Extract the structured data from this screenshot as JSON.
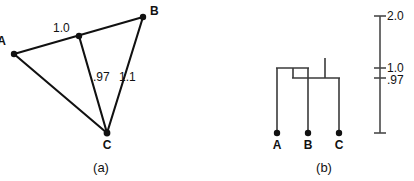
{
  "figure": {
    "panels": [
      {
        "id": "a",
        "caption": "(a)",
        "caption_x": 101,
        "caption_y": 172
      },
      {
        "id": "b",
        "caption": "(b)",
        "caption_x": 324,
        "caption_y": 172
      }
    ]
  },
  "panel_a": {
    "type": "triangle-network",
    "points": [
      {
        "name": "A",
        "x": 14,
        "y": 54,
        "label": "A",
        "label_x": 6,
        "label_y": 45
      },
      {
        "name": "B",
        "x": 143,
        "y": 17,
        "label": "B",
        "label_x": 150,
        "label_y": 15
      },
      {
        "name": "C",
        "x": 107,
        "y": 133,
        "label": "C",
        "label_x": 103,
        "label_y": 149
      },
      {
        "name": "M",
        "x": 79,
        "y": 36,
        "label": "",
        "label_x": 0,
        "label_y": 0
      }
    ],
    "edges": [
      {
        "from": "A",
        "to": "B",
        "distance_label": "1.0",
        "label_x": 53,
        "label_y": 32
      },
      {
        "from": "M",
        "to": "C",
        "distance_label": ".97",
        "label_x": 93,
        "label_y": 81
      },
      {
        "from": "B",
        "to": "C",
        "distance_label": "1.1",
        "label_x": 119,
        "label_y": 81
      },
      {
        "from": "A",
        "to": "C",
        "distance_label": "",
        "label_x": 0,
        "label_y": 0
      }
    ]
  },
  "panel_b": {
    "type": "dendrogram",
    "leaves": [
      {
        "name": "A",
        "label": "A",
        "x": 277,
        "dot_y": 133,
        "label_x": 277,
        "label_y": 148,
        "stem_top": 68
      },
      {
        "name": "B",
        "label": "B",
        "x": 308,
        "dot_y": 133,
        "label_x": 308,
        "label_y": 148,
        "stem_top": 68
      },
      {
        "name": "C",
        "label": "C",
        "x": 339,
        "dot_y": 133,
        "label_x": 339,
        "label_y": 148,
        "stem_top": 78
      }
    ],
    "joins": [
      {
        "name": "A-B",
        "height_label": "1.0",
        "bar_y": 68,
        "x_left": 277,
        "x_right": 308
      },
      {
        "name": "AB-C",
        "height_label": ".97",
        "bar_y": 78,
        "x_left": 293,
        "x_right": 339
      }
    ],
    "root_stem": {
      "x": 325,
      "y_top": 58,
      "y_bottom": 78
    }
  },
  "scale_bar": {
    "axis_x": 380,
    "y_top": 16,
    "y_bottom": 133,
    "tick_len": 6,
    "ticks": [
      {
        "value": "2.0",
        "y": 16,
        "label_x": 387,
        "label_y": 20
      },
      {
        "value": "1.0",
        "y": 68,
        "label_x": 387,
        "label_y": 72
      },
      {
        "value": ".97",
        "y": 78,
        "label_x": 387,
        "label_y": 84
      }
    ]
  },
  "colors": {
    "ink": "#111111",
    "line": "#3a3a3a",
    "background": "#ffffff"
  }
}
